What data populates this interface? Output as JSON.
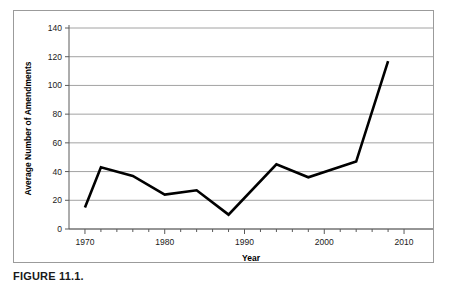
{
  "figure": {
    "caption": "FIGURE 11.1."
  },
  "chart_data": {
    "type": "line",
    "title": "",
    "subtitle": "",
    "xlabel": "Year",
    "ylabel": "Average Number of Amendments",
    "xlim": [
      1968,
      2012
    ],
    "ylim": [
      0,
      140
    ],
    "xticks": [
      1970,
      1972,
      1974,
      1976,
      1978,
      1980,
      1982,
      1984,
      1986,
      1988,
      1990,
      1992,
      1994,
      1996,
      1998,
      2000,
      2002,
      2004,
      2006,
      2008,
      2010
    ],
    "xtick_labels": [
      "1970",
      "",
      "",
      "",
      "",
      "1980",
      "",
      "",
      "",
      "",
      "1990",
      "",
      "",
      "",
      "",
      "2000",
      "",
      "",
      "",
      "",
      "2010"
    ],
    "yticks": [
      0,
      20,
      40,
      60,
      80,
      100,
      120,
      140
    ],
    "ytick_labels": [
      "0",
      "20",
      "40",
      "60",
      "80",
      "100",
      "120",
      "140"
    ],
    "grid": "horizontal",
    "legend": "none",
    "series": [
      {
        "name": "Average Number of Amendments",
        "color": "#000000",
        "x": [
          1970,
          1972,
          1976,
          1980,
          1984,
          1988,
          1994,
          1998,
          2004,
          2008
        ],
        "values": [
          15,
          43,
          37,
          24,
          27,
          10,
          45,
          36,
          47,
          117
        ]
      }
    ]
  }
}
